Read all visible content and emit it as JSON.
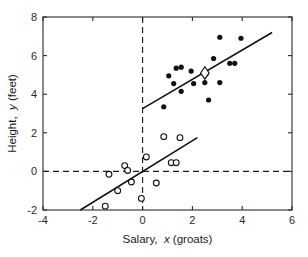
{
  "chart_data": {
    "type": "scatter",
    "title": "",
    "xlabel": "Salary,  x (groats)",
    "xlabel_parts": {
      "pre": "Salary,",
      "italic": "x",
      "post": "(groats)"
    },
    "ylabel": "Height,  y (feet)",
    "ylabel_parts": {
      "pre": "Height,",
      "italic": "y",
      "post": "(feet)"
    },
    "xlim": [
      -4,
      6
    ],
    "ylim": [
      -2,
      8
    ],
    "xticks": [
      -4,
      -2,
      0,
      2,
      4,
      6
    ],
    "xticklabels": [
      "-4",
      "-2",
      "0",
      "2",
      "4",
      "6"
    ],
    "yticks": [
      -2,
      0,
      2,
      4,
      6,
      8
    ],
    "yticklabels": [
      "-2",
      "0",
      "2",
      "4",
      "6",
      "8"
    ],
    "grid": false,
    "legend": "none",
    "reference_lines": [
      {
        "name": "vertical-zero",
        "orientation": "vertical",
        "value": 0,
        "style": "dashed"
      },
      {
        "name": "horizontal-zero",
        "orientation": "horizontal",
        "value": 0,
        "style": "dashed"
      }
    ],
    "series": [
      {
        "name": "upper-group-filled",
        "marker": "filled-circle",
        "points": [
          [
            0.85,
            3.35
          ],
          [
            1.05,
            4.95
          ],
          [
            1.35,
            5.35
          ],
          [
            1.25,
            4.55
          ],
          [
            1.55,
            5.4
          ],
          [
            1.55,
            4.15
          ],
          [
            1.95,
            5.2
          ],
          [
            2.05,
            4.55
          ],
          [
            2.5,
            4.6
          ],
          [
            2.55,
            5.05
          ],
          [
            2.65,
            3.7
          ],
          [
            2.85,
            5.85
          ],
          [
            3.1,
            6.95
          ],
          [
            3.1,
            4.6
          ],
          [
            3.5,
            5.6
          ],
          [
            3.7,
            5.6
          ],
          [
            3.95,
            6.9
          ]
        ]
      },
      {
        "name": "lower-group-open",
        "marker": "open-circle",
        "points": [
          [
            -1.5,
            -1.8
          ],
          [
            -1.35,
            -0.15
          ],
          [
            -1.0,
            -1.0
          ],
          [
            -0.72,
            0.3
          ],
          [
            -0.6,
            0.05
          ],
          [
            -0.45,
            -0.55
          ],
          [
            -0.05,
            -1.4
          ],
          [
            0.15,
            0.75
          ],
          [
            0.55,
            -0.6
          ],
          [
            0.85,
            1.8
          ],
          [
            1.15,
            0.45
          ],
          [
            1.35,
            0.45
          ],
          [
            1.5,
            1.75
          ]
        ]
      }
    ],
    "highlight_marker": {
      "name": "centroid-diamond",
      "marker": "open-diamond",
      "point": [
        2.5,
        5.1
      ]
    },
    "fit_lines": [
      {
        "name": "upper-regression-line",
        "x_start": 0.0,
        "y_start": 3.25,
        "x_end": 5.2,
        "y_end": 7.2
      },
      {
        "name": "lower-regression-line",
        "x_start": -2.5,
        "y_start": -2.0,
        "x_end": 2.2,
        "y_end": 1.75
      }
    ]
  }
}
